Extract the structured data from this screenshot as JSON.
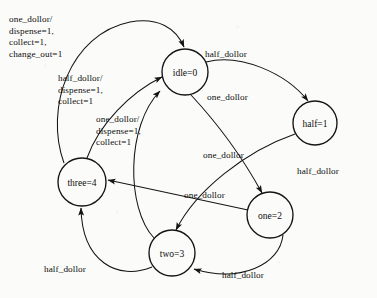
{
  "diagram": {
    "type": "finite-state-machine",
    "background_color": "#fbfbfa",
    "stroke_color": "#141414",
    "text_color": "#0d0d0d",
    "states": [
      {
        "id": "idle",
        "label": "idle=0",
        "cx": 185,
        "cy": 72,
        "r": 23
      },
      {
        "id": "half",
        "label": "half=1",
        "cx": 315,
        "cy": 123,
        "r": 22
      },
      {
        "id": "three",
        "label": "three=4",
        "cx": 82,
        "cy": 182,
        "r": 24
      },
      {
        "id": "two",
        "label": "two=3",
        "cx": 172,
        "cy": 253,
        "r": 23
      },
      {
        "id": "one",
        "label": "one=2",
        "cx": 270,
        "cy": 215,
        "r": 23
      }
    ],
    "edge_labels": [
      {
        "id": "one-dollor-change-out",
        "text": "one_dollor/\ndispense=1,\ncollect=1,\nchange_out=1",
        "x": 9,
        "y": 14
      },
      {
        "id": "half-dollor-dispense",
        "text": "half_dollor/\ndispense=1,\ncollect=1",
        "x": 58,
        "y": 73
      },
      {
        "id": "one-dollor-dispense",
        "text": "one_dollor/\ndispense=1,\ncollect=1",
        "x": 96,
        "y": 114
      },
      {
        "id": "half-dollor-idle-to-half",
        "text": "half_dollor",
        "x": 205,
        "y": 49
      },
      {
        "id": "one-dollor-idle-to-one",
        "text": "one_dollor",
        "x": 207,
        "y": 92
      },
      {
        "id": "one-dollor-half-to-one",
        "text": "one_dollor",
        "x": 203,
        "y": 150
      },
      {
        "id": "half-dollor-floating",
        "text": "half_dollor",
        "x": 297,
        "y": 166
      },
      {
        "id": "one-dollor-one-to-three",
        "text": "one_dollor",
        "x": 184,
        "y": 190
      },
      {
        "id": "half-dollor-two-to-three",
        "text": "half_dollor",
        "x": 44,
        "y": 264
      },
      {
        "id": "half-dollor-one-to-two",
        "text": "half_dollor",
        "x": 222,
        "y": 270
      }
    ],
    "transitions": [
      {
        "from": "three",
        "to": "idle",
        "label_ref": "one-dollor-change-out"
      },
      {
        "from": "three",
        "to": "idle",
        "label_ref": "half-dollor-dispense"
      },
      {
        "from": "two",
        "to": "idle",
        "label_ref": "one-dollor-dispense"
      },
      {
        "from": "idle",
        "to": "half",
        "label_ref": "half-dollor-idle-to-half"
      },
      {
        "from": "idle",
        "to": "one",
        "label_ref": "one-dollor-idle-to-one"
      },
      {
        "from": "half",
        "to": "two",
        "label_ref": "one-dollor-half-to-one"
      },
      {
        "from": "one",
        "to": "three",
        "label_ref": "one-dollor-one-to-three"
      },
      {
        "from": "two",
        "to": "three",
        "label_ref": "half-dollor-two-to-three"
      },
      {
        "from": "one",
        "to": "two",
        "label_ref": "half-dollor-one-to-two"
      }
    ]
  }
}
